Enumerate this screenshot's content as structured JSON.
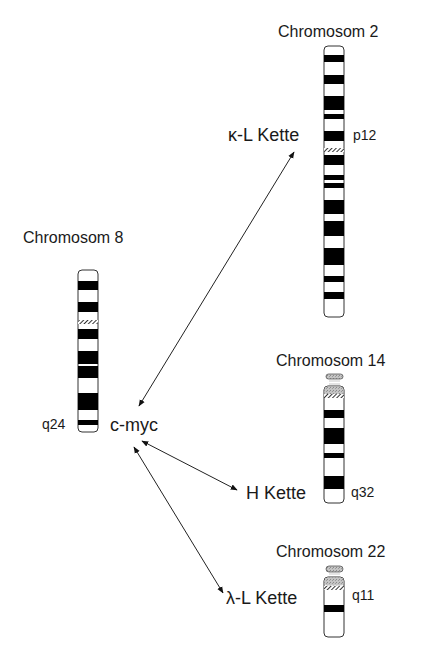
{
  "chromosomes": {
    "chr2": {
      "title": "Chromosom 2",
      "band_label": "p12"
    },
    "chr8": {
      "title": "Chromosom 8",
      "band_label": "q24"
    },
    "chr14": {
      "title": "Chromosom 14",
      "band_label": "q32"
    },
    "chr22": {
      "title": "Chromosom 22",
      "band_label": "q11"
    }
  },
  "genes": {
    "cmyc": "c-myc",
    "kappa": "κ-L Kette",
    "heavy": "H Kette",
    "lambda": "λ-L Kette"
  },
  "colors": {
    "band": "#000000",
    "outline": "#333333",
    "satellite": "#bdbdbd",
    "arrow": "#222222"
  }
}
